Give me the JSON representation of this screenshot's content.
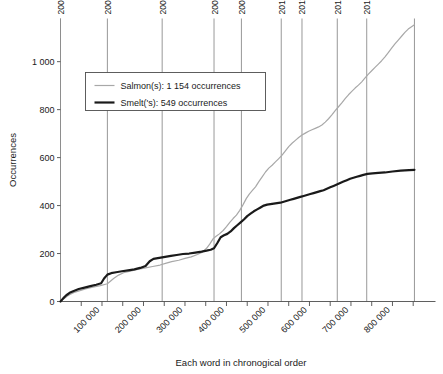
{
  "chart_data": {
    "type": "line",
    "title": "",
    "xlabel": "Each word in chronogical order",
    "ylabel": "Occurrences",
    "xlim": [
      0,
      870000
    ],
    "ylim": [
      0,
      1180
    ],
    "grid": "vertical year markers only",
    "legend_position": "upper-left inside plot",
    "xticks": [
      100000,
      200000,
      300000,
      400000,
      500000,
      600000,
      700000,
      800000
    ],
    "xtick_labels": [
      "100 000",
      "200 000",
      "300 000",
      "400 000",
      "500 000",
      "600 000",
      "700 000",
      "800 000"
    ],
    "yticks": [
      0,
      200,
      400,
      600,
      800,
      1000
    ],
    "ytick_labels": [
      "0",
      "200",
      "400",
      "600",
      "800",
      "1 000"
    ],
    "year_markers": [
      {
        "label": "2005",
        "x": 0
      },
      {
        "label": "2006",
        "x": 113000
      },
      {
        "label": "2007",
        "x": 245000
      },
      {
        "label": "2008",
        "x": 370000
      },
      {
        "label": "2009",
        "x": 436000
      },
      {
        "label": "2010",
        "x": 532000
      },
      {
        "label": "2011",
        "x": 582000
      },
      {
        "label": "2012",
        "x": 667000
      },
      {
        "label": "2013",
        "x": 738000
      },
      {
        "label": "",
        "x": 853000
      }
    ],
    "series": [
      {
        "name": "Salmon(s): 1 154 occurrences",
        "label": "Salmon(s)",
        "total": 1154,
        "color": "#a8a8a8",
        "width": 1.2,
        "points": [
          [
            0,
            0
          ],
          [
            9000,
            12
          ],
          [
            16000,
            22
          ],
          [
            24000,
            30
          ],
          [
            33000,
            38
          ],
          [
            45000,
            44
          ],
          [
            60000,
            52
          ],
          [
            78000,
            60
          ],
          [
            96000,
            66
          ],
          [
            113000,
            74
          ],
          [
            128000,
            96
          ],
          [
            140000,
            110
          ],
          [
            152000,
            120
          ],
          [
            168000,
            126
          ],
          [
            186000,
            134
          ],
          [
            205000,
            140
          ],
          [
            222000,
            146
          ],
          [
            240000,
            152
          ],
          [
            255000,
            160
          ],
          [
            268000,
            166
          ],
          [
            285000,
            172
          ],
          [
            300000,
            180
          ],
          [
            315000,
            186
          ],
          [
            330000,
            196
          ],
          [
            342000,
            206
          ],
          [
            352000,
            222
          ],
          [
            360000,
            240
          ],
          [
            368000,
            262
          ],
          [
            375000,
            272
          ],
          [
            383000,
            282
          ],
          [
            392000,
            296
          ],
          [
            400000,
            312
          ],
          [
            408000,
            330
          ],
          [
            416000,
            346
          ],
          [
            424000,
            360
          ],
          [
            432000,
            380
          ],
          [
            440000,
            404
          ],
          [
            448000,
            430
          ],
          [
            455000,
            448
          ],
          [
            462000,
            462
          ],
          [
            470000,
            478
          ],
          [
            478000,
            500
          ],
          [
            486000,
            520
          ],
          [
            494000,
            540
          ],
          [
            502000,
            556
          ],
          [
            510000,
            568
          ],
          [
            518000,
            582
          ],
          [
            526000,
            596
          ],
          [
            534000,
            610
          ],
          [
            542000,
            628
          ],
          [
            550000,
            646
          ],
          [
            558000,
            660
          ],
          [
            566000,
            672
          ],
          [
            574000,
            684
          ],
          [
            582000,
            694
          ],
          [
            590000,
            702
          ],
          [
            598000,
            710
          ],
          [
            606000,
            716
          ],
          [
            614000,
            722
          ],
          [
            622000,
            728
          ],
          [
            630000,
            736
          ],
          [
            638000,
            748
          ],
          [
            646000,
            762
          ],
          [
            654000,
            778
          ],
          [
            662000,
            796
          ],
          [
            670000,
            812
          ],
          [
            678000,
            828
          ],
          [
            686000,
            846
          ],
          [
            694000,
            862
          ],
          [
            702000,
            876
          ],
          [
            710000,
            890
          ],
          [
            718000,
            902
          ],
          [
            726000,
            916
          ],
          [
            734000,
            932
          ],
          [
            742000,
            948
          ],
          [
            750000,
            962
          ],
          [
            758000,
            976
          ],
          [
            766000,
            990
          ],
          [
            774000,
            1004
          ],
          [
            782000,
            1020
          ],
          [
            790000,
            1038
          ],
          [
            798000,
            1056
          ],
          [
            806000,
            1074
          ],
          [
            814000,
            1090
          ],
          [
            822000,
            1106
          ],
          [
            830000,
            1122
          ],
          [
            838000,
            1136
          ],
          [
            846000,
            1146
          ],
          [
            853000,
            1154
          ]
        ]
      },
      {
        "name": "Smelt('s): 549 occurrences",
        "label": "Smelt('s)",
        "total": 549,
        "color": "#1a1a1a",
        "width": 2.2,
        "points": [
          [
            0,
            0
          ],
          [
            7000,
            14
          ],
          [
            14000,
            26
          ],
          [
            22000,
            36
          ],
          [
            32000,
            44
          ],
          [
            44000,
            52
          ],
          [
            58000,
            58
          ],
          [
            72000,
            64
          ],
          [
            86000,
            70
          ],
          [
            98000,
            76
          ],
          [
            105000,
            96
          ],
          [
            113000,
            112
          ],
          [
            122000,
            118
          ],
          [
            134000,
            122
          ],
          [
            148000,
            126
          ],
          [
            163000,
            130
          ],
          [
            178000,
            134
          ],
          [
            192000,
            140
          ],
          [
            205000,
            148
          ],
          [
            215000,
            168
          ],
          [
            224000,
            178
          ],
          [
            238000,
            182
          ],
          [
            252000,
            186
          ],
          [
            266000,
            190
          ],
          [
            280000,
            194
          ],
          [
            295000,
            198
          ],
          [
            310000,
            200
          ],
          [
            325000,
            204
          ],
          [
            340000,
            208
          ],
          [
            352000,
            212
          ],
          [
            362000,
            216
          ],
          [
            370000,
            222
          ],
          [
            378000,
            244
          ],
          [
            386000,
            268
          ],
          [
            394000,
            276
          ],
          [
            402000,
            282
          ],
          [
            410000,
            292
          ],
          [
            418000,
            306
          ],
          [
            426000,
            318
          ],
          [
            434000,
            330
          ],
          [
            442000,
            342
          ],
          [
            450000,
            356
          ],
          [
            458000,
            366
          ],
          [
            466000,
            376
          ],
          [
            474000,
            384
          ],
          [
            482000,
            392
          ],
          [
            490000,
            400
          ],
          [
            498000,
            404
          ],
          [
            506000,
            406
          ],
          [
            514000,
            408
          ],
          [
            522000,
            410
          ],
          [
            530000,
            412
          ],
          [
            538000,
            416
          ],
          [
            546000,
            420
          ],
          [
            554000,
            424
          ],
          [
            562000,
            428
          ],
          [
            570000,
            432
          ],
          [
            578000,
            436
          ],
          [
            586000,
            440
          ],
          [
            594000,
            444
          ],
          [
            602000,
            448
          ],
          [
            610000,
            452
          ],
          [
            618000,
            456
          ],
          [
            626000,
            460
          ],
          [
            634000,
            464
          ],
          [
            642000,
            470
          ],
          [
            650000,
            476
          ],
          [
            658000,
            482
          ],
          [
            666000,
            488
          ],
          [
            674000,
            494
          ],
          [
            682000,
            500
          ],
          [
            690000,
            506
          ],
          [
            698000,
            512
          ],
          [
            706000,
            516
          ],
          [
            714000,
            520
          ],
          [
            722000,
            524
          ],
          [
            730000,
            528
          ],
          [
            740000,
            532
          ],
          [
            752000,
            534
          ],
          [
            766000,
            536
          ],
          [
            782000,
            538
          ],
          [
            800000,
            542
          ],
          [
            820000,
            546
          ],
          [
            840000,
            548
          ],
          [
            853000,
            549
          ]
        ]
      }
    ]
  },
  "axes": {
    "y_title": "Occurrences",
    "x_title": "Each word in chronogical order"
  }
}
